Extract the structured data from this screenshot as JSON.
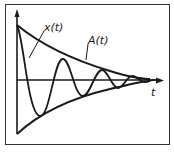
{
  "figure": {
    "type": "damped-oscillation-diagram",
    "labels": {
      "oscillation": "x(t)",
      "envelope": "A(t)",
      "time_axis": "t"
    },
    "colors": {
      "ink": "#1a1a1a",
      "background": "#ffffff",
      "frame": "#333333"
    }
  }
}
